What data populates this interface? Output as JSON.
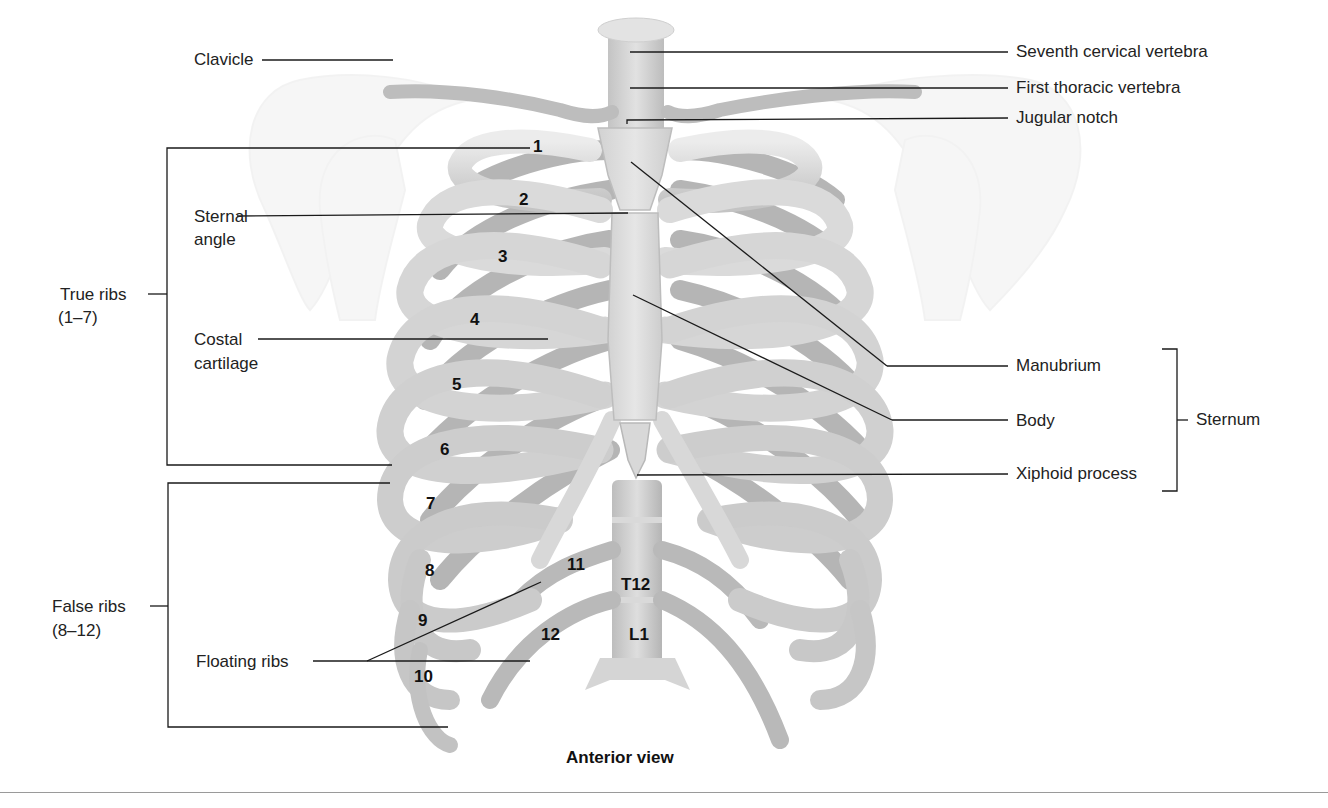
{
  "figure": {
    "caption": "Anterior view"
  },
  "labels": {
    "seventh_cervical_vertebra": "Seventh cervical vertebra",
    "first_thoracic_vertebra": "First thoracic vertebra",
    "jugular_notch": "Jugular notch",
    "clavicle": "Clavicle",
    "sternal_angle_line1": "Sternal",
    "sternal_angle_line2": "angle",
    "true_ribs_line1": "True ribs",
    "true_ribs_line2": "(1–7)",
    "costal_cartilage_line1": "Costal",
    "costal_cartilage_line2": "cartilage",
    "false_ribs_line1": "False ribs",
    "false_ribs_line2": "(8–12)",
    "floating_ribs": "Floating ribs",
    "manubrium": "Manubrium",
    "body": "Body",
    "xiphoid_process": "Xiphoid process",
    "sternum": "Sternum"
  },
  "rib_numbers": [
    "1",
    "2",
    "3",
    "4",
    "5",
    "6",
    "7",
    "8",
    "9",
    "10",
    "11",
    "12"
  ],
  "vertebra_labels": {
    "t12": "T12",
    "l1": "L1"
  },
  "groups": {
    "true_ribs_range": "1–7",
    "false_ribs_range": "8–12",
    "sternum_parts": [
      "Manubrium",
      "Body",
      "Xiphoid process"
    ]
  },
  "colors": {
    "bone_light": "#e4e4e4",
    "bone_mid": "#c9c9c9",
    "bone_dark": "#9b9b9b",
    "bone_shadow": "#a8a8a8",
    "leader_line": "#1a1a1a",
    "text": "#222222"
  }
}
